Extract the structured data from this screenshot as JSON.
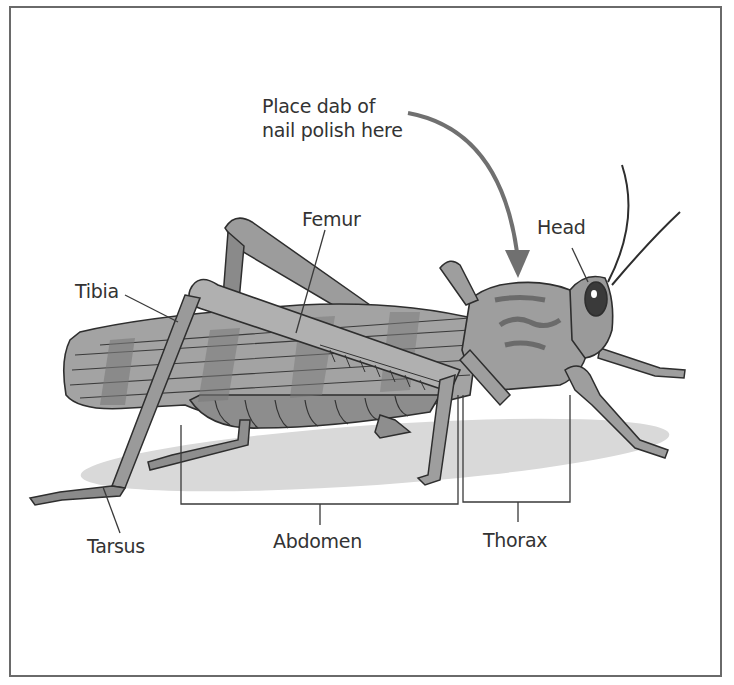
{
  "diagram": {
    "callout": {
      "line1": "Place dab of",
      "line2": "nail polish here",
      "arrow_color": "#707070"
    },
    "labels": {
      "femur": "Femur",
      "tibia": "Tibia",
      "head": "Head",
      "tarsus": "Tarsus",
      "abdomen": "Abdomen",
      "thorax": "Thorax"
    },
    "colors": {
      "frame": "#6a6a6a",
      "body": "#9a9a9a",
      "body_light": "#b8b8b8",
      "body_dark": "#6f6f6f",
      "shadow": "#d6d6d6",
      "outline": "#2e2e2e",
      "text": "#333333"
    }
  }
}
